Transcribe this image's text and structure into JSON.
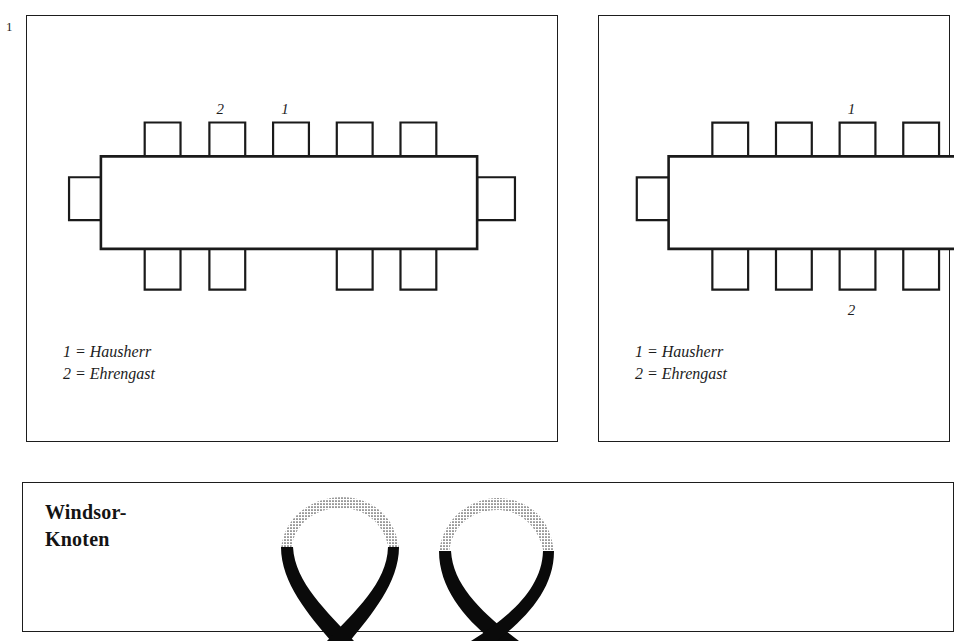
{
  "figure": {
    "number": "1"
  },
  "panels": {
    "seating_left": {
      "name": "seating-plan-left",
      "table": {
        "shape": "rectangle",
        "orientation": "horizontal"
      },
      "chairs": {
        "top_count": 5,
        "bottom_count": 4,
        "left_count": 1,
        "right_count": 1,
        "total": 11
      },
      "seat_markers": [
        {
          "label": "2",
          "side": "top",
          "index": 2
        },
        {
          "label": "1",
          "side": "top",
          "index": 3
        }
      ],
      "legend": [
        "1 = Hausherr",
        "2 = Ehrengast"
      ]
    },
    "seating_right": {
      "name": "seating-plan-right",
      "table": {
        "shape": "rectangle",
        "orientation": "horizontal"
      },
      "chairs": {
        "top_count": 4,
        "bottom_count": 4,
        "left_count": 1,
        "right_count": 0,
        "total": 9
      },
      "seat_markers": [
        {
          "label": "1",
          "side": "top",
          "index": 3
        },
        {
          "label": "2",
          "side": "bottom",
          "index": 3
        }
      ],
      "legend": [
        "1 = Hausherr",
        "2 = Ehrengast"
      ]
    },
    "tie": {
      "name": "windsor-knot-panel",
      "title_lines": [
        "Windsor-",
        "Knoten"
      ],
      "steps": [
        {
          "step": 1,
          "description": "tie-draped-loop"
        },
        {
          "step": 2,
          "description": "tie-crossed-loop"
        }
      ]
    }
  },
  "colors": {
    "ink": "#1a1a1a",
    "paper": "#ffffff",
    "tie_black": "#0a0a0a",
    "collar_stipple": "#4a4a4a"
  }
}
